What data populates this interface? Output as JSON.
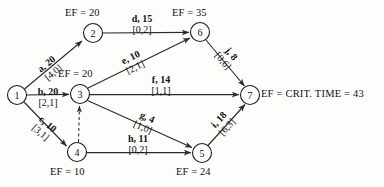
{
  "diagram": {
    "type": "project-network-aoa",
    "title_text": "EF = CRIT. TIME = 43",
    "nodes": [
      {
        "id": "1",
        "label": "1",
        "cx": 17,
        "cy": 95,
        "r": 9.5,
        "ef": null
      },
      {
        "id": "2",
        "label": "2",
        "cx": 93,
        "cy": 33,
        "r": 9.5,
        "ef": "EF = 20"
      },
      {
        "id": "3",
        "label": "3",
        "cx": 80,
        "cy": 94,
        "r": 9.5,
        "ef": "EF = 20"
      },
      {
        "id": "4",
        "label": "4",
        "cx": 77,
        "cy": 152,
        "r": 9.5,
        "ef": "EF = 10"
      },
      {
        "id": "5",
        "label": "5",
        "cx": 202,
        "cy": 153,
        "r": 9.5,
        "ef": "EF = 24"
      },
      {
        "id": "6",
        "label": "6",
        "cx": 200,
        "cy": 32,
        "r": 9.5,
        "ef": "EF = 35"
      },
      {
        "id": "7",
        "label": "7",
        "cx": 250,
        "cy": 95,
        "r": 9.5,
        "ef": "EF = CRIT. TIME = 43"
      }
    ],
    "edges": [
      {
        "id": "a",
        "from": "1",
        "to": "2",
        "activity": "a",
        "duration": "20",
        "top": "a, 20",
        "bottom": "[4,0]",
        "slack": "[4,0]",
        "style": "solid"
      },
      {
        "id": "b",
        "from": "1",
        "to": "3",
        "activity": "b",
        "duration": "20",
        "top": "b, 20",
        "bottom": "[2,1]",
        "slack": "[2,1]",
        "style": "solid"
      },
      {
        "id": "c",
        "from": "1",
        "to": "4",
        "activity": "c",
        "duration": "10",
        "top": "c, 10",
        "bottom": "[3,1]",
        "slack": "[3,1]",
        "style": "solid"
      },
      {
        "id": "d",
        "from": "2",
        "to": "6",
        "activity": "d",
        "duration": "15",
        "top": "d, 15",
        "bottom": "[0,2]",
        "slack": "[0,2]",
        "style": "solid"
      },
      {
        "id": "e",
        "from": "3",
        "to": "6",
        "activity": "e",
        "duration": "10",
        "top": "e, 10",
        "bottom": "[2,1]",
        "slack": "[2,1]",
        "style": "solid"
      },
      {
        "id": "f",
        "from": "3",
        "to": "7",
        "activity": "f",
        "duration": "14",
        "top": "f, 14",
        "bottom": "[1,1]",
        "slack": "[1,1]",
        "style": "solid"
      },
      {
        "id": "g",
        "from": "3",
        "to": "5",
        "activity": "g",
        "duration": "4",
        "top": "g, 4",
        "bottom": "[1,0]",
        "slack": "[1,0]",
        "style": "solid"
      },
      {
        "id": "h",
        "from": "4",
        "to": "5",
        "activity": "h",
        "duration": "11",
        "top": "h, 11",
        "bottom": "[0,2]",
        "slack": "[0,2]",
        "style": "solid"
      },
      {
        "id": "i",
        "from": "5",
        "to": "7",
        "activity": "i",
        "duration": "18",
        "top": "i, 18",
        "bottom": "[6,3]",
        "slack": "[6,3]",
        "style": "solid"
      },
      {
        "id": "j",
        "from": "6",
        "to": "7",
        "activity": "j",
        "duration": "8",
        "top": "j, 8",
        "bottom": "[0,6]",
        "slack": "[0,6]",
        "style": "solid"
      },
      {
        "id": "dummy",
        "from": "4",
        "to": "3",
        "activity": "",
        "duration": "",
        "top": "",
        "bottom": "",
        "slack": "",
        "style": "dashed"
      }
    ],
    "labels": {
      "ef_node2": "EF = 20",
      "ef_node3": "EF = 20",
      "ef_node6": "EF = 35",
      "ef_node4": "EF = 10",
      "ef_node5": "EF = 24",
      "crit_time": "EF = CRIT. TIME = 43",
      "node1": "1",
      "node2": "2",
      "node3": "3",
      "node4": "4",
      "node5": "5",
      "node6": "6",
      "node7": "7",
      "a_top": "a, 20",
      "a_bot": "[4,0]",
      "b_top": "b, 20",
      "b_bot": "[2,1]",
      "c_top": "c, 10",
      "c_bot": "[3,1]",
      "d_top": "d, 15",
      "d_bot": "[0,2]",
      "e_top": "e, 10",
      "e_bot": "[2,1]",
      "f_top": "f, 14",
      "f_bot": "[1,1]",
      "g_top": "g, 4",
      "g_bot": "[1,0]",
      "h_top": "h, 11",
      "h_bot": "[0,2]",
      "i_top": "i, 18",
      "i_bot": "[6,3]",
      "j_top": "j, 8",
      "j_bot": "[0,6]"
    },
    "colors": {
      "stroke": "#2b2b2b",
      "text": "#111111",
      "background": "#fdfdfc"
    }
  }
}
